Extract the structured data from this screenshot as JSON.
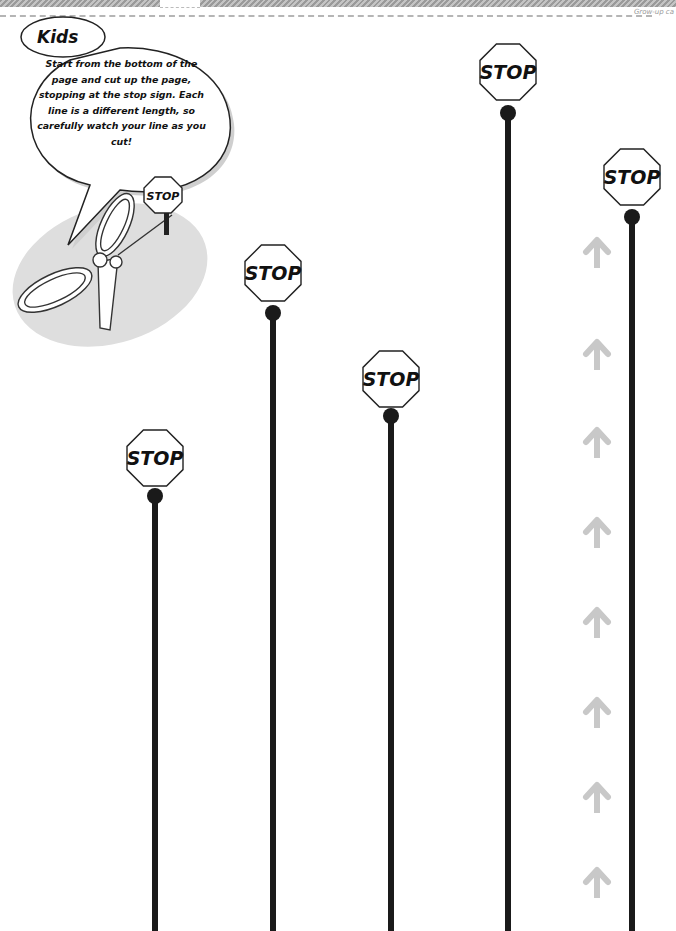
{
  "page": {
    "corner_text": "Grow-up ca",
    "colors": {
      "line": "#1a1a1a",
      "arrow": "#c8c8c8",
      "strip": "#a8a8a8",
      "ellipse": "#dcdcdc"
    }
  },
  "bubble": {
    "title": "Kids",
    "instructions": "Start from the bottom of the page and cut up the page, stopping at the stop sign. Each line is a different length, so carefully watch your line as you cut!",
    "mascot_sign": "STOP"
  },
  "cut_lines": [
    {
      "id": 1,
      "x": 155,
      "sign_y": 458,
      "dot_y": 496,
      "label": "STOP"
    },
    {
      "id": 2,
      "x": 273,
      "sign_y": 273,
      "dot_y": 313,
      "label": "STOP"
    },
    {
      "id": 3,
      "x": 391,
      "sign_y": 379,
      "dot_y": 416,
      "label": "STOP"
    },
    {
      "id": 4,
      "x": 508,
      "sign_y": 72,
      "dot_y": 113,
      "label": "STOP"
    },
    {
      "id": 5,
      "x": 632,
      "sign_y": 177,
      "dot_y": 217,
      "label": "STOP"
    }
  ],
  "arrows": {
    "x": 597,
    "direction": "up",
    "y_positions": [
      250,
      352,
      440,
      530,
      620,
      710,
      795,
      880
    ]
  }
}
